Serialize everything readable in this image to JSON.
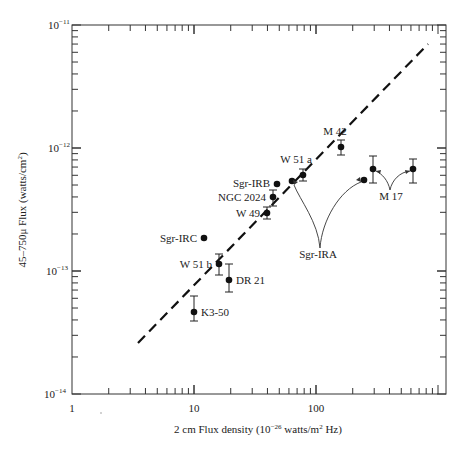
{
  "chart_data": {
    "type": "scatter",
    "title": "",
    "xlabel": "2 cm Flux density (10^-26 watts/m^2 Hz)",
    "ylabel": "45–750μ Flux (watts/cm^2)",
    "xscale": "log",
    "yscale": "log",
    "xlim": [
      1,
      1000
    ],
    "ylim": [
      1e-14,
      1e-11
    ],
    "grid": false,
    "x_tick_labels": [
      "1",
      "10",
      "100"
    ],
    "y_tick_labels": [
      "10^-11",
      "10^-12",
      "10^-13",
      "10^-14"
    ],
    "points": [
      {
        "name": "M 42",
        "x": 260,
        "y": 1.8e-12,
        "yerr": [
          1.5e-12,
          2.1e-12
        ]
      },
      {
        "name": "W 51 a",
        "x": 125,
        "y": 6.3e-13,
        "yerr": [
          5.6e-13,
          7.2e-13
        ]
      },
      {
        "name": "Sgr-IRA (low)",
        "x": 63,
        "y": 5.6e-13
      },
      {
        "name": "Sgr-IRA (high)",
        "x": 245,
        "y": 5.7e-13
      },
      {
        "name": "Sgr-IRB",
        "x": 75,
        "y": 5.3e-13
      },
      {
        "name": "NGC 2024",
        "x": 70,
        "y": 4.1e-13,
        "yerr": [
          3.5e-13,
          4.8e-13
        ]
      },
      {
        "name": "W 49",
        "x": 63,
        "y": 3e-13,
        "yerr": [
          2.7e-13,
          3.4e-13
        ]
      },
      {
        "name": "M 17 (low)",
        "x": 200,
        "y": 7.3e-13,
        "yerr": [
          5.6e-13,
          9.4e-13
        ]
      },
      {
        "name": "M 17 (high)",
        "x": 420,
        "y": 7.3e-13,
        "yerr": [
          5.6e-13,
          8.9e-13
        ]
      },
      {
        "name": "Sgr-IRC",
        "x": 13,
        "y": 1.9e-13
      },
      {
        "name": "W 51 b",
        "x": 17,
        "y": 1.2e-13,
        "yerr": [
          1e-13,
          1.5e-13
        ]
      },
      {
        "name": "DR 21",
        "x": 20,
        "y": 8.5e-14,
        "yerr": [
          7.2e-14,
          1.15e-13
        ]
      },
      {
        "name": "K3-50",
        "x": 10,
        "y": 4.7e-14,
        "yerr": [
          3.7e-14,
          6.6e-14
        ]
      }
    ],
    "fit_line": {
      "style": "dashed",
      "x": [
        3.7,
        900
      ],
      "y": [
        2.7e-14,
        4e-12
      ]
    },
    "annotations": [
      {
        "text": "M 42"
      },
      {
        "text": "W 51 a"
      },
      {
        "text": "Sgr-IRB"
      },
      {
        "text": "NGC 2024"
      },
      {
        "text": "W 49"
      },
      {
        "text": "Sgr-IRC"
      },
      {
        "text": "W 51 b"
      },
      {
        "text": "DR 21"
      },
      {
        "text": "K3-50"
      },
      {
        "text": "Sgr-IRA"
      },
      {
        "text": "M 17"
      }
    ]
  },
  "labels": {
    "x_axis": "2 cm Flux density (10",
    "x_axis_exp": "−26",
    "x_axis_mid": " watts/m",
    "x_axis_sup2": "2",
    "x_axis_end": " Hz)",
    "y_axis": "45–750μ Flux (watts/cm",
    "y_axis_sup": "2",
    "y_axis_end": ")",
    "x_ticks": [
      "1",
      "10",
      "100"
    ],
    "y_ticks_base": "10",
    "y_ticks_exp": [
      "−11",
      "−12",
      "−13",
      "−14"
    ],
    "points": {
      "m42": "M 42",
      "w51a": "W 51 a",
      "sgrirb": "Sgr-IRB",
      "ngc2024": "NGC 2024",
      "w49": "W 49",
      "sgrirc": "Sgr-IRC",
      "w51b": "W 51 b",
      "dr21": "DR 21",
      "k350": "K3-50",
      "sgrira": "Sgr-IRA",
      "m17": "M 17"
    }
  }
}
